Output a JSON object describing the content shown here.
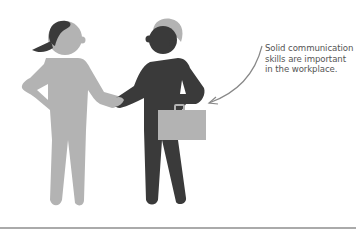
{
  "illustration": {
    "subject": "handshake between two people",
    "figures": [
      {
        "name": "woman",
        "body_color": "#b3b3b3",
        "hair_color": "#3a3a3a"
      },
      {
        "name": "man",
        "body_color": "#3a3a3a",
        "hair_color": "#b3b3b3",
        "accessory": "briefcase",
        "accessory_color": "#b3b3b3"
      }
    ]
  },
  "callout": {
    "lines": [
      "Solid communication",
      "skills are important",
      "in the workplace."
    ],
    "arrow_color": "#888888",
    "text_color": "#555555"
  },
  "colors": {
    "background": "#ffffff",
    "light_gray": "#b3b3b3",
    "dark_gray": "#3a3a3a",
    "baseline": "#aaaaaa"
  }
}
